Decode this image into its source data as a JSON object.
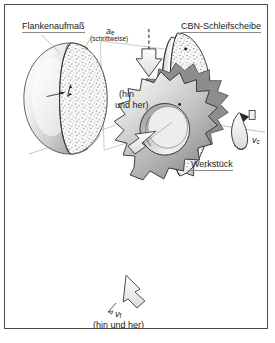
{
  "figure": {
    "title_alt": "CBN-Profilschleifen einer Verzahnung",
    "border_color": "#4a4a4a",
    "background_color": "#ffffff"
  },
  "labels": {
    "flankenaufmass": "Flankenaufmaß",
    "infeed_symbol": "a",
    "infeed_subscript": "e",
    "infeed_note": "(schrittweise)",
    "grinding_wheel": "CBN-Schleifscheibe",
    "oscillation_line1": "(hin",
    "oscillation_line2": "und her)",
    "cutting_speed_symbol": "v",
    "cutting_speed_subscript": "c",
    "workpiece": "Werkstück",
    "feed_symbol": "v",
    "feed_subscript": "f",
    "feed_note": "(hin und her)"
  },
  "colors": {
    "outline": "#2b2b2b",
    "leader": "#9a9a9a",
    "gear_light": "#f2f2f2",
    "gear_mid": "#b8b8b8",
    "gear_dark": "#7d7d7d",
    "abrasive": "#3a3a3a",
    "abrasive_bg": "#ffffff",
    "arrow_fill": "#f4f4f4",
    "text": "#1a1a1a"
  },
  "icons": {
    "infeed_arrow": "down-arrow-icon",
    "oscillation_arrow": "double-arrow-icon",
    "rotation_arrow": "curved-rotation-arrow-icon",
    "feed_arrow": "feed-arrow-icon",
    "detail_callout": "magnification-callout-icon"
  }
}
